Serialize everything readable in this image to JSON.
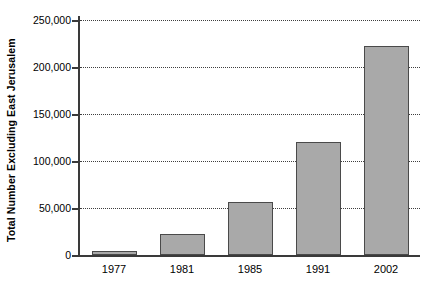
{
  "chart_data": {
    "type": "bar",
    "title": "",
    "xlabel": "",
    "ylabel": "Total Number Excluding East Jerusalem",
    "categories": [
      "1977",
      "1981",
      "1985",
      "1991",
      "2002"
    ],
    "values": [
      4000,
      22000,
      56000,
      120000,
      222000
    ],
    "ylim": [
      0,
      250000
    ],
    "ytick_values": [
      0,
      50000,
      100000,
      150000,
      200000,
      250000
    ],
    "ytick_labels": [
      "0",
      "50,000",
      "100,000",
      "150,000",
      "200,000",
      "250,000"
    ],
    "grid": true,
    "grid_axis": "y",
    "grid_style": "dotted",
    "legend": null,
    "bar_color": "#a9a9a9",
    "bar_edge_color": "#4a4a4a",
    "axis_color": "#3a3a3a",
    "background_color": "#ffffff",
    "series": [
      {
        "name": "Total Number Excluding East Jerusalem",
        "values": [
          4000,
          22000,
          56000,
          120000,
          222000
        ]
      }
    ]
  }
}
